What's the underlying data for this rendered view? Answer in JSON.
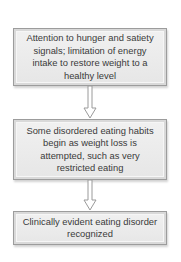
{
  "diagram": {
    "type": "flowchart",
    "direction": "top-to-bottom",
    "colors": {
      "box_fill": "#ebebeb",
      "box_border": "#9c9c9c",
      "arrow_stroke": "#9a9a9a",
      "text": "#3a3a3a"
    },
    "steps": [
      {
        "text": "Attention to hunger and satiety signals; limitation of energy intake to restore weight to a healthy level"
      },
      {
        "text": "Some disordered eating habits begin as weight loss is attempted, such as very restricted eating"
      },
      {
        "text": "Clinically evident eating disorder recognized"
      }
    ],
    "connectors": [
      {
        "from": 0,
        "to": 1,
        "style": "hollow-down-arrow"
      },
      {
        "from": 1,
        "to": 2,
        "style": "hollow-down-arrow"
      }
    ]
  }
}
